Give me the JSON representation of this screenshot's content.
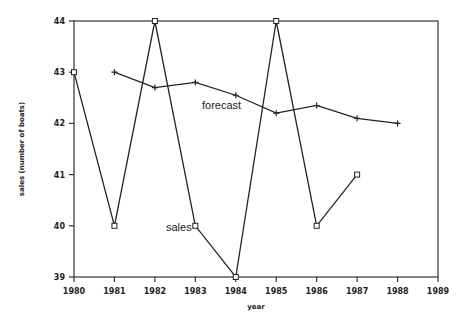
{
  "chart_data": {
    "type": "line",
    "title": "",
    "xlabel": "year",
    "ylabel": "sales (number of boats)",
    "xlim": [
      1980,
      1989
    ],
    "ylim": [
      39,
      44
    ],
    "x_ticks": [
      "1980",
      "1981",
      "1982",
      "1983",
      "1984",
      "1985",
      "1986",
      "1987",
      "1988",
      "1989"
    ],
    "y_ticks": [
      "39",
      "40",
      "41",
      "42",
      "43",
      "44"
    ],
    "grid": false,
    "legend": "inline labels",
    "series": [
      {
        "name": "sales",
        "marker": "square",
        "x": [
          1980,
          1981,
          1982,
          1983,
          1984,
          1985,
          1986,
          1987
        ],
        "values": [
          43,
          40,
          44,
          40,
          39,
          44,
          40,
          41
        ]
      },
      {
        "name": "forecast",
        "marker": "plus",
        "x": [
          1981,
          1982,
          1983,
          1984,
          1985,
          1986,
          1987,
          1988
        ],
        "values": [
          43.0,
          42.7,
          42.8,
          42.55,
          42.2,
          42.35,
          42.1,
          42.0
        ]
      }
    ],
    "annotations": [
      {
        "text": "forecast",
        "x": 1983.2,
        "y": 42.35
      },
      {
        "text": "sales",
        "x": 1982.3,
        "y": 40.0
      }
    ]
  },
  "labels": {
    "xlabel": "year",
    "ylabel": "sales (number of boats)",
    "forecast": "forecast",
    "sales": "sales"
  }
}
